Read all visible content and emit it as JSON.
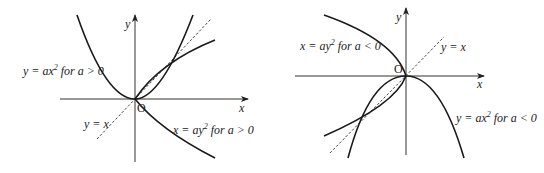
{
  "figure": {
    "left_panel": {
      "axis_x_label": "x",
      "axis_y_label": "y",
      "origin_label": "O",
      "curve_labels": {
        "parabola_y": {
          "lhs": "y = ax",
          "exp": "2",
          "rhs": " for a > 0"
        },
        "parabola_x": {
          "lhs": "x = ay",
          "exp": "2",
          "rhs": " for a > 0"
        },
        "line": "y = x"
      }
    },
    "right_panel": {
      "axis_x_label": "x",
      "axis_y_label": "y",
      "origin_label": "O",
      "curve_labels": {
        "parabola_x": {
          "lhs": "x = ay",
          "exp": "2",
          "rhs": " for a < 0"
        },
        "parabola_y": {
          "lhs": "y = ax",
          "exp": "2",
          "rhs": " for a < 0"
        },
        "line": "y = x"
      }
    }
  }
}
